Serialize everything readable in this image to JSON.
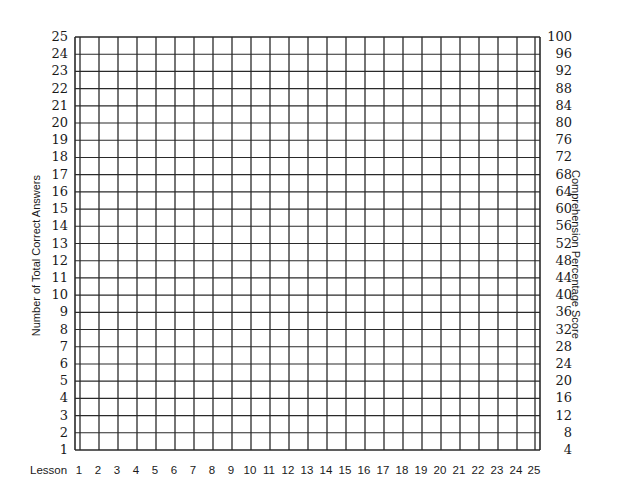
{
  "chart_data": {
    "type": "table",
    "title": "",
    "xlabel": "Lesson",
    "ylabel_left": "Number of Total Correct Answers",
    "ylabel_right": "Comprehension Percentage Score",
    "x_ticks": [
      "1",
      "2",
      "3",
      "4",
      "5",
      "6",
      "7",
      "8",
      "9",
      "10",
      "11",
      "12",
      "13",
      "14",
      "15",
      "16",
      "17",
      "18",
      "19",
      "20",
      "21",
      "22",
      "23",
      "24",
      "25"
    ],
    "y_left_ticks": [
      "25",
      "24",
      "23",
      "22",
      "21",
      "20",
      "19",
      "18",
      "17",
      "16",
      "15",
      "14",
      "13",
      "12",
      "11",
      "10",
      "9",
      "8",
      "7",
      "6",
      "5",
      "4",
      "3",
      "2",
      "1"
    ],
    "y_right_ticks": [
      "100",
      "96",
      "92",
      "88",
      "84",
      "80",
      "76",
      "72",
      "68",
      "64",
      "60",
      "56",
      "52",
      "48",
      "44",
      "40",
      "36",
      "32",
      "28",
      "24",
      "20",
      "16",
      "12",
      "8",
      "4"
    ],
    "ylim_left": [
      1,
      25
    ],
    "ylim_right": [
      4,
      100
    ],
    "grid": true,
    "series": []
  },
  "labels": {
    "lesson": "Lesson",
    "left_axis": "Number of Total Correct Answers",
    "right_axis": "Comprehension Percentage Score"
  },
  "colors": {
    "grid_line": "#2a2a2a",
    "text": "#1a1a1a",
    "background": "#ffffff"
  }
}
